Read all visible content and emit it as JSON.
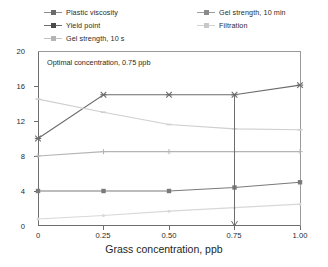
{
  "chart_data": {
    "type": "line",
    "title": "",
    "xlabel": "Grass concentration, ppb",
    "ylabel": "",
    "x": [
      0,
      0.25,
      0.5,
      0.75,
      1.0
    ],
    "xtick_labels": [
      "0",
      "0.25",
      "0.50",
      "0.75",
      "1.00"
    ],
    "ytick_labels": [
      "0",
      "4",
      "8",
      "12",
      "16",
      "20"
    ],
    "ytick_values": [
      0,
      4,
      8,
      12,
      16,
      20
    ],
    "xlim": [
      0,
      1.0
    ],
    "ylim": [
      0,
      20
    ],
    "grid": false,
    "legend_position": "top",
    "series": [
      {
        "name": "Plastic viscosity",
        "values": [
          10.0,
          15.0,
          15.0,
          15.0,
          16.1
        ],
        "color": "#6b6b6b",
        "marker": "star"
      },
      {
        "name": "Yield point",
        "values": [
          4.0,
          4.0,
          4.0,
          4.4,
          5.0
        ],
        "color": "#7a7a7a",
        "marker": "square"
      },
      {
        "name": "Gel strength, 10 s",
        "values": [
          8.0,
          8.5,
          8.5,
          8.5,
          8.5
        ],
        "color": "#b4b4b4",
        "marker": "plus"
      },
      {
        "name": "Gel strength, 10 min",
        "values": [
          14.5,
          13.0,
          11.6,
          11.1,
          11.0
        ],
        "color": "#cfcfcf",
        "marker": "dash"
      },
      {
        "name": "Filtration",
        "values": [
          0.8,
          1.2,
          1.7,
          2.1,
          2.5
        ],
        "color": "#d8d8d8",
        "marker": "dot"
      }
    ],
    "annotations": [
      {
        "name": "optimal-concentration-note",
        "text": "Optimal concentration, 0.75 ppb",
        "x": 0.04,
        "y": 18.3
      },
      {
        "name": "optimal-concentration-arrow",
        "type": "vertical-arrow",
        "x": 0.75,
        "y_from": 15.0,
        "y_to": 0.0
      }
    ]
  },
  "legend": {
    "items": [
      {
        "label": "Plastic viscosity",
        "color": "#6b6b6b"
      },
      {
        "label": "Gel strength, 10 min",
        "color": "#9d9d9d"
      },
      {
        "label": "Yield point",
        "color": "#5f5f5f"
      },
      {
        "label": "Filtration",
        "color": "#d2d2d2"
      },
      {
        "label": "Gel strength, 10 s",
        "color": "#c3c3c3"
      }
    ]
  },
  "axes": {
    "x_label": "Grass concentration, ppb",
    "x_ticks": [
      "0",
      "0.25",
      "0.50",
      "0.75",
      "1.00"
    ],
    "y_ticks": [
      "0",
      "4",
      "8",
      "12",
      "16",
      "20"
    ]
  },
  "note": {
    "text": "Optimal concentration, 0.75 ppb"
  }
}
